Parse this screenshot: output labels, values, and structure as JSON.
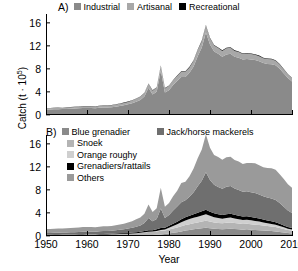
{
  "axes": {
    "ylabel_text": "Catch (t · 10",
    "ylabel_exp": "5",
    "ylabel_close": ")",
    "xlabel": "Year",
    "yticks": [
      "0",
      "4",
      "8",
      "12",
      "16"
    ],
    "ytick_values": [
      0,
      4,
      8,
      12,
      16
    ],
    "xticks": [
      "1950",
      "1960",
      "1970",
      "1980",
      "1990",
      "2000",
      "2010"
    ],
    "xtick_values": [
      1950,
      1960,
      1970,
      1980,
      1990,
      2000,
      2010
    ]
  },
  "colors": {
    "industrial": "#8a8a8a",
    "artisanal": "#a8a8a8",
    "recreational": "#000000",
    "blue_grenadier": "#8a8a8a",
    "snoek": "#b4b4b4",
    "orange_roughy": "#cfcfcf",
    "grenadiers_rattails": "#000000",
    "others": "#9a9a9a",
    "jack_horse_mackerels": "#6f6f6f",
    "axis": "#000000"
  },
  "panelA": {
    "tag": "A)",
    "legend": [
      {
        "label": "Industrial",
        "color_key": "industrial"
      },
      {
        "label": "Artisanal",
        "color_key": "artisanal"
      },
      {
        "label": "Recreational",
        "color_key": "recreational"
      }
    ]
  },
  "panelB": {
    "tag": "B)",
    "legend_left": [
      {
        "label": "Blue grenadier",
        "color_key": "blue_grenadier"
      },
      {
        "label": "Snoek",
        "color_key": "snoek"
      },
      {
        "label": "Orange roughy",
        "color_key": "orange_roughy"
      },
      {
        "label": "Grenadiers/rattails",
        "color_key": "grenadiers_rattails"
      },
      {
        "label": "Others",
        "color_key": "others"
      }
    ],
    "legend_right": [
      {
        "label": "Jack/horse mackerels",
        "color_key": "jack_horse_mackerels"
      }
    ]
  },
  "chart_data": [
    {
      "type": "area",
      "panel": "A",
      "title": "A)",
      "xlabel": "Year",
      "ylabel": "Catch (t · 10^5)",
      "xlim": [
        1950,
        2010
      ],
      "ylim": [
        0,
        17.5
      ],
      "grid": false,
      "stacked": true,
      "legend_position": "top",
      "x": [
        1950,
        1951,
        1952,
        1953,
        1954,
        1955,
        1956,
        1957,
        1958,
        1959,
        1960,
        1961,
        1962,
        1963,
        1964,
        1965,
        1966,
        1967,
        1968,
        1969,
        1970,
        1971,
        1972,
        1973,
        1974,
        1975,
        1976,
        1977,
        1978,
        1979,
        1980,
        1981,
        1982,
        1983,
        1984,
        1985,
        1986,
        1987,
        1988,
        1989,
        1990,
        1991,
        1992,
        1993,
        1994,
        1995,
        1996,
        1997,
        1998,
        1999,
        2000,
        2001,
        2002,
        2003,
        2004,
        2005,
        2006,
        2007,
        2008,
        2009,
        2010
      ],
      "series": [
        {
          "name": "Industrial",
          "values": [
            0.95,
            0.95,
            0.98,
            1.0,
            1.02,
            1.05,
            1.08,
            1.12,
            1.15,
            1.2,
            1.22,
            1.2,
            1.18,
            1.25,
            1.32,
            1.3,
            1.35,
            1.45,
            1.55,
            1.7,
            1.85,
            2.05,
            2.3,
            2.6,
            3.2,
            4.7,
            3.55,
            4.05,
            7.7,
            3.9,
            4.3,
            5.2,
            5.9,
            6.6,
            6.6,
            7.3,
            8.4,
            10.2,
            11.7,
            14.3,
            12.2,
            11.0,
            10.6,
            10.1,
            10.5,
            10.6,
            10.1,
            9.9,
            9.6,
            9.7,
            9.6,
            9.55,
            9.3,
            9.0,
            8.85,
            8.8,
            8.6,
            8.0,
            7.2,
            6.4,
            5.8
          ]
        },
        {
          "name": "Artisanal",
          "values": [
            0.25,
            0.25,
            0.25,
            0.26,
            0.26,
            0.27,
            0.27,
            0.28,
            0.28,
            0.3,
            0.3,
            0.3,
            0.3,
            0.32,
            0.33,
            0.33,
            0.35,
            0.36,
            0.38,
            0.4,
            0.42,
            0.45,
            0.5,
            0.55,
            0.6,
            0.7,
            0.65,
            0.7,
            0.8,
            0.7,
            0.75,
            0.8,
            0.85,
            0.9,
            0.9,
            0.95,
            1.0,
            1.05,
            1.1,
            1.2,
            1.1,
            1.05,
            1.0,
            1.0,
            1.05,
            1.05,
            1.0,
            1.0,
            0.95,
            0.95,
            0.95,
            0.9,
            0.9,
            0.85,
            0.85,
            0.85,
            0.8,
            0.75,
            0.7,
            0.65,
            0.6
          ]
        },
        {
          "name": "Recreational",
          "values": [
            0.03,
            0.03,
            0.03,
            0.03,
            0.03,
            0.03,
            0.03,
            0.03,
            0.03,
            0.04,
            0.04,
            0.04,
            0.04,
            0.04,
            0.04,
            0.04,
            0.04,
            0.05,
            0.05,
            0.05,
            0.05,
            0.05,
            0.06,
            0.06,
            0.06,
            0.07,
            0.07,
            0.07,
            0.08,
            0.07,
            0.08,
            0.08,
            0.08,
            0.09,
            0.09,
            0.09,
            0.1,
            0.1,
            0.1,
            0.11,
            0.1,
            0.1,
            0.1,
            0.1,
            0.1,
            0.1,
            0.1,
            0.1,
            0.09,
            0.09,
            0.09,
            0.09,
            0.09,
            0.08,
            0.08,
            0.08,
            0.08,
            0.07,
            0.07,
            0.06,
            0.06
          ]
        }
      ]
    },
    {
      "type": "area",
      "panel": "B",
      "title": "B)",
      "xlabel": "Year",
      "ylabel": "Catch (t · 10^5)",
      "xlim": [
        1950,
        2010
      ],
      "ylim": [
        0,
        17.5
      ],
      "grid": false,
      "stacked": true,
      "legend_position": "top",
      "x": [
        1950,
        1951,
        1952,
        1953,
        1954,
        1955,
        1956,
        1957,
        1958,
        1959,
        1960,
        1961,
        1962,
        1963,
        1964,
        1965,
        1966,
        1967,
        1968,
        1969,
        1970,
        1971,
        1972,
        1973,
        1974,
        1975,
        1976,
        1977,
        1978,
        1979,
        1980,
        1981,
        1982,
        1983,
        1984,
        1985,
        1986,
        1987,
        1988,
        1989,
        1990,
        1991,
        1992,
        1993,
        1994,
        1995,
        1996,
        1997,
        1998,
        1999,
        2000,
        2001,
        2002,
        2003,
        2004,
        2005,
        2006,
        2007,
        2008,
        2009,
        2010
      ],
      "series": [
        {
          "name": "Blue grenadier",
          "values": [
            0.02,
            0.02,
            0.02,
            0.02,
            0.02,
            0.02,
            0.02,
            0.02,
            0.02,
            0.02,
            0.03,
            0.03,
            0.03,
            0.03,
            0.03,
            0.04,
            0.04,
            0.04,
            0.05,
            0.05,
            0.06,
            0.07,
            0.08,
            0.1,
            0.12,
            0.15,
            0.18,
            0.22,
            0.28,
            0.35,
            0.45,
            0.55,
            0.65,
            0.8,
            0.95,
            1.05,
            1.15,
            1.25,
            1.35,
            1.45,
            1.35,
            1.25,
            1.2,
            1.15,
            1.2,
            1.25,
            1.2,
            1.15,
            1.1,
            1.15,
            1.1,
            1.05,
            1.0,
            0.95,
            0.9,
            0.85,
            0.8,
            0.7,
            0.6,
            0.5,
            0.45
          ]
        },
        {
          "name": "Snoek",
          "values": [
            0.15,
            0.15,
            0.16,
            0.16,
            0.17,
            0.17,
            0.18,
            0.18,
            0.19,
            0.2,
            0.2,
            0.2,
            0.2,
            0.22,
            0.23,
            0.23,
            0.25,
            0.26,
            0.28,
            0.3,
            0.32,
            0.35,
            0.38,
            0.42,
            0.48,
            0.55,
            0.52,
            0.58,
            0.65,
            0.6,
            0.68,
            0.75,
            0.82,
            0.9,
            0.95,
            1.0,
            1.05,
            1.1,
            1.15,
            1.2,
            1.15,
            1.1,
            1.05,
            1.05,
            1.1,
            1.1,
            1.05,
            1.0,
            0.98,
            0.98,
            0.95,
            0.92,
            0.9,
            0.85,
            0.82,
            0.8,
            0.75,
            0.7,
            0.62,
            0.55,
            0.5
          ]
        },
        {
          "name": "Orange roughy",
          "values": [
            0.01,
            0.01,
            0.01,
            0.01,
            0.01,
            0.01,
            0.01,
            0.01,
            0.01,
            0.01,
            0.01,
            0.01,
            0.01,
            0.01,
            0.01,
            0.01,
            0.01,
            0.02,
            0.02,
            0.02,
            0.02,
            0.02,
            0.03,
            0.03,
            0.04,
            0.05,
            0.06,
            0.08,
            0.12,
            0.18,
            0.28,
            0.42,
            0.55,
            0.7,
            0.8,
            0.88,
            0.95,
            1.0,
            1.05,
            1.1,
            1.0,
            0.92,
            0.85,
            0.8,
            0.82,
            0.85,
            0.8,
            0.75,
            0.7,
            0.7,
            0.68,
            0.65,
            0.6,
            0.55,
            0.5,
            0.45,
            0.4,
            0.35,
            0.28,
            0.22,
            0.18
          ]
        },
        {
          "name": "Grenadiers/rattails",
          "values": [
            0.05,
            0.05,
            0.05,
            0.06,
            0.06,
            0.06,
            0.07,
            0.07,
            0.07,
            0.08,
            0.08,
            0.08,
            0.08,
            0.09,
            0.09,
            0.1,
            0.1,
            0.11,
            0.12,
            0.13,
            0.14,
            0.15,
            0.17,
            0.19,
            0.22,
            0.26,
            0.25,
            0.28,
            0.33,
            0.3,
            0.35,
            0.4,
            0.45,
            0.5,
            0.55,
            0.58,
            0.62,
            0.68,
            0.72,
            0.78,
            0.72,
            0.68,
            0.65,
            0.62,
            0.65,
            0.66,
            0.62,
            0.6,
            0.58,
            0.58,
            0.56,
            0.54,
            0.52,
            0.5,
            0.48,
            0.46,
            0.42,
            0.38,
            0.33,
            0.28,
            0.25
          ]
        },
        {
          "name": "Jack/horse mackerels",
          "values": [
            0.3,
            0.3,
            0.32,
            0.33,
            0.34,
            0.36,
            0.37,
            0.39,
            0.41,
            0.43,
            0.44,
            0.43,
            0.42,
            0.46,
            0.49,
            0.48,
            0.52,
            0.56,
            0.6,
            0.68,
            0.75,
            0.85,
            0.96,
            1.1,
            1.4,
            2.1,
            1.55,
            1.8,
            3.4,
            1.7,
            1.9,
            2.3,
            2.65,
            2.95,
            2.95,
            3.3,
            3.8,
            4.6,
            5.3,
            6.5,
            5.5,
            4.95,
            4.75,
            4.55,
            4.75,
            4.8,
            4.55,
            4.45,
            4.3,
            4.35,
            4.3,
            4.28,
            4.18,
            4.05,
            3.98,
            3.95,
            3.88,
            3.6,
            3.25,
            2.88,
            2.6
          ]
        },
        {
          "name": "Others",
          "values": [
            0.7,
            0.7,
            0.7,
            0.71,
            0.71,
            0.73,
            0.73,
            0.76,
            0.76,
            0.8,
            0.8,
            0.79,
            0.78,
            0.8,
            0.85,
            0.81,
            0.82,
            0.88,
            0.91,
            0.96,
            1.03,
            1.11,
            1.28,
            1.37,
            1.6,
            2.36,
            1.61,
            1.86,
            3.6,
            1.94,
            2.07,
            2.48,
            2.71,
            3.34,
            3.19,
            3.53,
            4.13,
            4.82,
            5.43,
            6.58,
            5.58,
            5.15,
            5.2,
            5.03,
            5.13,
            5.09,
            4.96,
            4.95,
            4.81,
            4.91,
            5.05,
            5.16,
            5.08,
            5.03,
            5.1,
            5.22,
            5.23,
            4.99,
            4.81,
            4.52,
            4.38
          ]
        }
      ]
    }
  ]
}
